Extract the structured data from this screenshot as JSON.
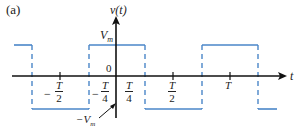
{
  "figure": {
    "panel_label": "(a)",
    "y_axis_label": "v(t)",
    "x_axis_label": "t",
    "high_label": "V",
    "high_sub": "m",
    "low_label": "−V",
    "low_sub": "m",
    "origin_label": "0",
    "colors": {
      "waveform": "#4a86c8",
      "axis": "#111111",
      "text": "#222222"
    },
    "ticks": [
      {
        "sign": "−",
        "num": "T",
        "den": "2"
      },
      {
        "sign": "−",
        "num": "T",
        "den": "4"
      },
      {
        "sign": "",
        "num": "T",
        "den": "4"
      },
      {
        "sign": "",
        "num": "T",
        "den": "2"
      },
      {
        "sign": "",
        "num": "T",
        "den": ""
      }
    ]
  }
}
